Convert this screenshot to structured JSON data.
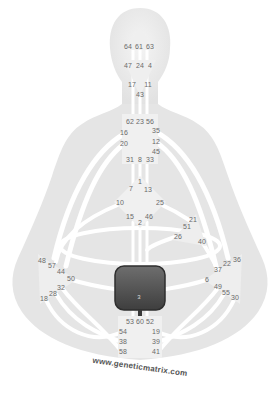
{
  "watermark": "www.geneticmatrix.com",
  "colors": {
    "silhouette": "#e4e4e4",
    "center_undefined": "#eeeeee",
    "channel": "#ffffff",
    "sacral_defined": "#4a4a4a",
    "gate_text": "#6a6a6a"
  },
  "centers": {
    "head": {
      "name": "Head",
      "defined": false,
      "gates": [
        "64",
        "61",
        "63"
      ]
    },
    "ajna": {
      "name": "Ajna",
      "defined": false,
      "gates": [
        "47",
        "24",
        "4",
        "17",
        "11",
        "43"
      ]
    },
    "throat": {
      "name": "Throat",
      "defined": false,
      "gates": [
        "62",
        "23",
        "56",
        "16",
        "35",
        "20",
        "12",
        "45",
        "31",
        "8",
        "33"
      ]
    },
    "g": {
      "name": "G Center",
      "defined": false,
      "gates": [
        "1",
        "7",
        "13",
        "10",
        "25",
        "15",
        "2",
        "46"
      ]
    },
    "ego": {
      "name": "Ego",
      "defined": false,
      "gates": [
        "21",
        "51",
        "26",
        "40"
      ]
    },
    "spleen": {
      "name": "Spleen",
      "defined": false,
      "gates": [
        "48",
        "57",
        "44",
        "50",
        "32",
        "28",
        "18"
      ]
    },
    "solar_plexus": {
      "name": "Solar Plexus",
      "defined": false,
      "gates": [
        "36",
        "22",
        "37",
        "6",
        "49",
        "55",
        "30"
      ]
    },
    "sacral": {
      "name": "Sacral",
      "defined": true,
      "gates": [
        "3"
      ]
    },
    "root": {
      "name": "Root",
      "defined": false,
      "gates": [
        "53",
        "60",
        "52",
        "54",
        "19",
        "38",
        "39",
        "58",
        "41"
      ]
    }
  },
  "gate_labels": [
    {
      "id": "64",
      "x": 128,
      "y": 46
    },
    {
      "id": "61",
      "x": 139,
      "y": 46
    },
    {
      "id": "63",
      "x": 150,
      "y": 46
    },
    {
      "id": "47",
      "x": 128,
      "y": 65
    },
    {
      "id": "24",
      "x": 140,
      "y": 65
    },
    {
      "id": "4",
      "x": 150,
      "y": 65
    },
    {
      "id": "17",
      "x": 132,
      "y": 84
    },
    {
      "id": "11",
      "x": 148,
      "y": 84
    },
    {
      "id": "43",
      "x": 140,
      "y": 94
    },
    {
      "id": "62",
      "x": 130,
      "y": 121
    },
    {
      "id": "23",
      "x": 140,
      "y": 121
    },
    {
      "id": "56",
      "x": 150,
      "y": 121
    },
    {
      "id": "16",
      "x": 124,
      "y": 132
    },
    {
      "id": "35",
      "x": 156,
      "y": 130
    },
    {
      "id": "20",
      "x": 124,
      "y": 143
    },
    {
      "id": "12",
      "x": 156,
      "y": 141
    },
    {
      "id": "45",
      "x": 156,
      "y": 151
    },
    {
      "id": "31",
      "x": 130,
      "y": 159
    },
    {
      "id": "8",
      "x": 140,
      "y": 159
    },
    {
      "id": "33",
      "x": 150,
      "y": 159
    },
    {
      "id": "1",
      "x": 140,
      "y": 181
    },
    {
      "id": "7",
      "x": 131,
      "y": 188
    },
    {
      "id": "13",
      "x": 148,
      "y": 189
    },
    {
      "id": "10",
      "x": 120,
      "y": 202
    },
    {
      "id": "25",
      "x": 160,
      "y": 202
    },
    {
      "id": "15",
      "x": 130,
      "y": 216
    },
    {
      "id": "46",
      "x": 149,
      "y": 216
    },
    {
      "id": "2",
      "x": 140,
      "y": 222
    },
    {
      "id": "21",
      "x": 193,
      "y": 219
    },
    {
      "id": "51",
      "x": 187,
      "y": 226
    },
    {
      "id": "26",
      "x": 178,
      "y": 236
    },
    {
      "id": "40",
      "x": 202,
      "y": 241
    },
    {
      "id": "48",
      "x": 42,
      "y": 260
    },
    {
      "id": "57",
      "x": 52,
      "y": 265
    },
    {
      "id": "44",
      "x": 61,
      "y": 271
    },
    {
      "id": "50",
      "x": 71,
      "y": 278
    },
    {
      "id": "32",
      "x": 61,
      "y": 287
    },
    {
      "id": "28",
      "x": 53,
      "y": 293
    },
    {
      "id": "18",
      "x": 44,
      "y": 298
    },
    {
      "id": "36",
      "x": 237,
      "y": 259
    },
    {
      "id": "22",
      "x": 227,
      "y": 263
    },
    {
      "id": "37",
      "x": 218,
      "y": 269
    },
    {
      "id": "6",
      "x": 207,
      "y": 279
    },
    {
      "id": "49",
      "x": 218,
      "y": 286
    },
    {
      "id": "55",
      "x": 226,
      "y": 292
    },
    {
      "id": "30",
      "x": 235,
      "y": 297
    },
    {
      "id": "53",
      "x": 130,
      "y": 321
    },
    {
      "id": "60",
      "x": 140,
      "y": 321
    },
    {
      "id": "52",
      "x": 150,
      "y": 321
    },
    {
      "id": "54",
      "x": 123,
      "y": 331
    },
    {
      "id": "19",
      "x": 156,
      "y": 331
    },
    {
      "id": "38",
      "x": 123,
      "y": 341
    },
    {
      "id": "39",
      "x": 156,
      "y": 341
    },
    {
      "id": "58",
      "x": 123,
      "y": 351
    },
    {
      "id": "41",
      "x": 156,
      "y": 351
    }
  ],
  "sacral_gate_label": "3"
}
